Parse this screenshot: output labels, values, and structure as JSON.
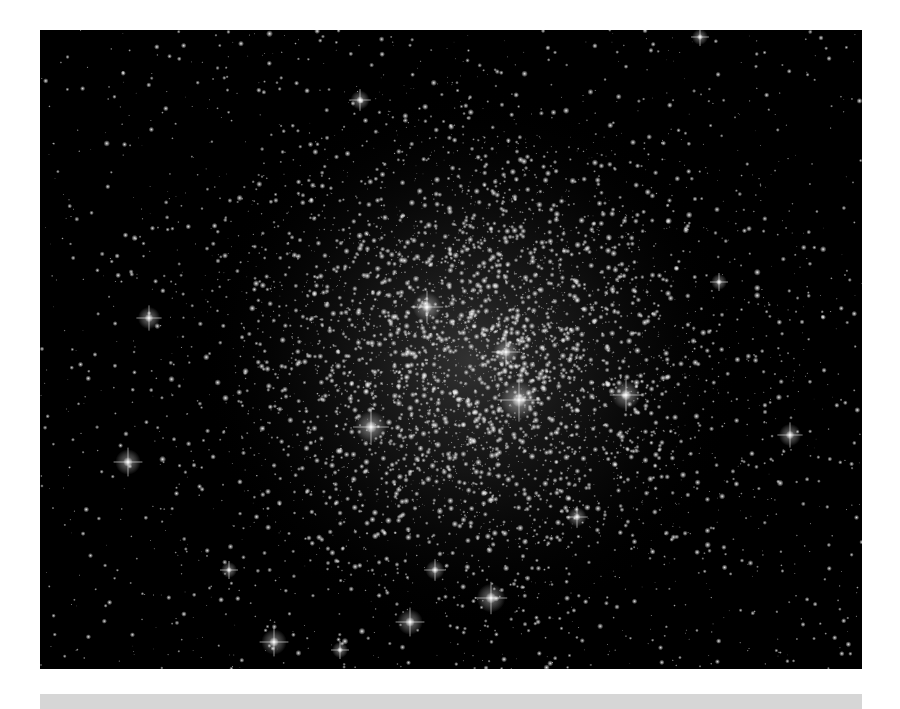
{
  "image": {
    "subject": "globular star cluster",
    "background_color": "#000000",
    "frame": {
      "left": 40,
      "top": 30,
      "width": 822,
      "height": 639
    },
    "cluster_center": {
      "x": 430,
      "y": 330
    },
    "star_color": "#ffffff",
    "seed": 1337,
    "field_star_count": 1400,
    "cluster_star_count": 4200,
    "cluster_core_radius": 170,
    "bright_stars": [
      {
        "x": 479,
        "y": 370,
        "r": 12
      },
      {
        "x": 586,
        "y": 365,
        "r": 9
      },
      {
        "x": 331,
        "y": 397,
        "r": 10
      },
      {
        "x": 387,
        "y": 277,
        "r": 9
      },
      {
        "x": 466,
        "y": 322,
        "r": 8
      },
      {
        "x": 109,
        "y": 288,
        "r": 7
      },
      {
        "x": 88,
        "y": 432,
        "r": 8
      },
      {
        "x": 750,
        "y": 405,
        "r": 7
      },
      {
        "x": 451,
        "y": 568,
        "r": 9
      },
      {
        "x": 370,
        "y": 592,
        "r": 8
      },
      {
        "x": 234,
        "y": 612,
        "r": 8
      },
      {
        "x": 320,
        "y": 70,
        "r": 6
      },
      {
        "x": 189,
        "y": 540,
        "r": 5
      },
      {
        "x": 537,
        "y": 487,
        "r": 6
      },
      {
        "x": 395,
        "y": 540,
        "r": 6
      },
      {
        "x": 300,
        "y": 620,
        "r": 5
      },
      {
        "x": 679,
        "y": 252,
        "r": 5
      },
      {
        "x": 660,
        "y": 7,
        "r": 5
      }
    ]
  },
  "caption_bar": {
    "color": "#d6d6d6"
  }
}
